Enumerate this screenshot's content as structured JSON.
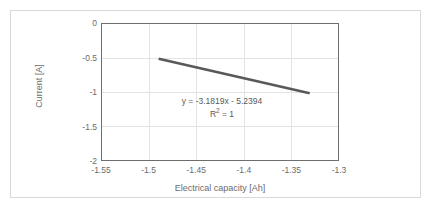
{
  "chart_data": {
    "type": "line",
    "title": "",
    "xlabel": "Electrical capacity [Ah]",
    "ylabel": "Current [A]",
    "xlim": [
      -1.55,
      -1.3
    ],
    "ylim": [
      -2,
      0
    ],
    "xticks": [
      "-1.55",
      "-1.5",
      "-1.45",
      "-1.4",
      "-1.35",
      "-1.3"
    ],
    "xtick_values": [
      -1.55,
      -1.5,
      -1.45,
      -1.4,
      -1.35,
      -1.3
    ],
    "yticks": [
      "0",
      "-0.5",
      "-1",
      "-1.5",
      "-2"
    ],
    "ytick_values": [
      0,
      -0.5,
      -1,
      -1.5,
      -2
    ],
    "grid": true,
    "legend": "none",
    "series": [
      {
        "name": "Current vs Electrical capacity",
        "color": "#595959",
        "x": [
          -1.49,
          -1.33
        ],
        "y": [
          -0.5105,
          -1.0196
        ]
      }
    ],
    "trendline": {
      "equation": "y = -3.1819x - 5.2394",
      "slope": -3.1819,
      "intercept": -5.2394,
      "r_squared_label": "R² = 1",
      "r_squared_value": 1
    },
    "colors": {
      "series": "#595959",
      "gridline": "#e3e3e3",
      "plot_border": "#6e6e6e",
      "frame_border": "#d9d9d9",
      "tick_text": "#6b6b6b",
      "annotation_text": "#595959",
      "background": "#ffffff"
    }
  },
  "annotation": {
    "equation": "y = -3.1819x - 5.2394",
    "r2_prefix": "R",
    "r2_exponent": "2",
    "r2_suffix": " = 1"
  }
}
